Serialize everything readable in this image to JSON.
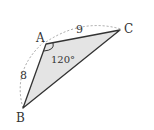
{
  "diagram": {
    "type": "triangle",
    "vertices": {
      "A": {
        "label": "A",
        "x": 46,
        "y": 44
      },
      "B": {
        "label": "B",
        "x": 23,
        "y": 108
      },
      "C": {
        "label": "C",
        "x": 120,
        "y": 30
      }
    },
    "sides": {
      "AB": {
        "label": "8"
      },
      "AC": {
        "label": "9"
      }
    },
    "angle_A": {
      "label": "120°"
    },
    "colors": {
      "fill": "#e4e4e4",
      "stroke": "#333333",
      "dashed_arc": "#999999"
    }
  }
}
